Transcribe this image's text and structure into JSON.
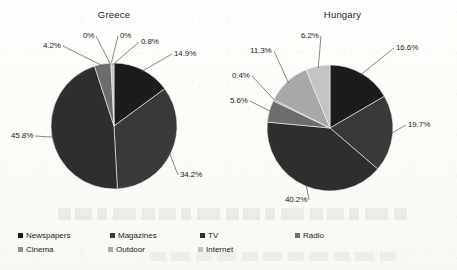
{
  "chart_data": [
    {
      "type": "pie",
      "title": "Greece",
      "categories": [
        "Newspapers",
        "Magazines",
        "TV",
        "Radio",
        "Cinema",
        "Outdoor",
        "Internet"
      ],
      "values": [
        14.9,
        34.2,
        45.8,
        4.2,
        0,
        0,
        0.8
      ],
      "labels": [
        "14.9%",
        "34.2%",
        "45.8%",
        "4.2%",
        "0%",
        "0%",
        "0.8%"
      ],
      "colors": [
        "#1c1c1c",
        "#3a3a3a",
        "#2e2e2e",
        "#6d6d6d",
        "#8f8f8f",
        "#a8a8a8",
        "#c4c4c4"
      ],
      "legend_position": "bottom",
      "grid": false
    },
    {
      "type": "pie",
      "title": "Hungary",
      "categories": [
        "Newspapers",
        "Magazines",
        "TV",
        "Radio",
        "Cinema",
        "Outdoor",
        "Internet"
      ],
      "values": [
        16.6,
        19.7,
        40.2,
        5.6,
        0.4,
        11.3,
        6.2
      ],
      "labels": [
        "16.6%",
        "19.7%",
        "40.2%",
        "5.6%",
        "0.4%",
        "11.3%",
        "6.2%"
      ],
      "colors": [
        "#1c1c1c",
        "#3a3a3a",
        "#2e2e2e",
        "#6d6d6d",
        "#8f8f8f",
        "#a8a8a8",
        "#c4c4c4"
      ],
      "legend_position": "bottom",
      "grid": false
    }
  ],
  "legend": {
    "rows": [
      [
        {
          "label": "Newspapers",
          "color": "#1c1c1c"
        },
        {
          "label": "Magazines",
          "color": "#3a3a3a"
        },
        {
          "label": "TV",
          "color": "#2e2e2e"
        },
        {
          "label": "Radio",
          "color": "#6d6d6d"
        }
      ],
      [
        {
          "label": "Cinema",
          "color": "#8f8f8f"
        },
        {
          "label": "Outdoor",
          "color": "#a8a8a8"
        },
        {
          "label": "Internet",
          "color": "#c4c4c4"
        }
      ]
    ]
  }
}
